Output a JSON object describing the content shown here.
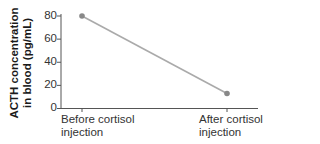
{
  "chart_data": {
    "type": "line",
    "title": "",
    "xlabel": "",
    "ylabel": "ACTH concentration in blood (pg/mL)",
    "ylabel_lines": [
      "ACTH concentration",
      "in blood (pg/mL)"
    ],
    "categories": [
      "Before cortisol injection",
      "After cortisol injection"
    ],
    "category_lines": [
      [
        "Before cortisol",
        "injection"
      ],
      [
        "After cortisol",
        "injection"
      ]
    ],
    "series": [
      {
        "name": "ACTH",
        "values": [
          80,
          13
        ]
      }
    ],
    "ylim": [
      0,
      80
    ],
    "yticks": [
      0,
      20,
      40,
      60,
      80
    ],
    "grid": false,
    "legend": "none",
    "colors": {
      "line": "#aaaaaa",
      "marker": "#888888",
      "axis": "#555555",
      "text": "#333333"
    }
  }
}
